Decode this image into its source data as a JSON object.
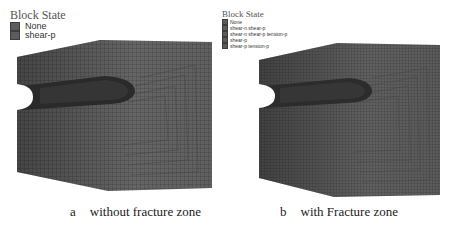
{
  "figure": {
    "panels": [
      {
        "id": "a",
        "legend": {
          "title": "Block State",
          "items": [
            {
              "label": "None",
              "color": "#5c5c5c"
            },
            {
              "label": "shear-p",
              "color": "#5c5c5c"
            }
          ]
        },
        "caption": {
          "letter": "a",
          "text": "without fracture zone"
        }
      },
      {
        "id": "b",
        "legend": {
          "title": "Block State",
          "items": [
            {
              "label": "None",
              "color": "#5c5c5c"
            },
            {
              "label": "shear-n shear-p",
              "color": "#5c5c5c"
            },
            {
              "label": "shear-n shear-p tension-p",
              "color": "#5c5c5c"
            },
            {
              "label": "shear-p",
              "color": "#5c5c5c"
            },
            {
              "label": "shear-p tension-p",
              "color": "#5c5c5c"
            }
          ]
        },
        "caption": {
          "letter": "b",
          "text": "with Fracture zone"
        }
      }
    ],
    "colors": {
      "mesh_fill": "#6e6e6e",
      "mesh_line": "#3a3a3a",
      "tunnel": "#2a2a2a",
      "background": "#ffffff"
    }
  }
}
